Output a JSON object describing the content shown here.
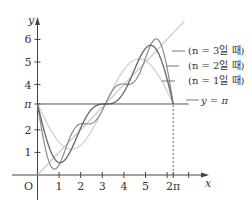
{
  "chart_data": {
    "type": "line",
    "title": "",
    "xlabel": "x",
    "ylabel": "y",
    "origin_label": "O",
    "xlim": [
      0,
      7.6
    ],
    "ylim": [
      0,
      6.7
    ],
    "grid": false,
    "x_ticks": [
      {
        "value": 1,
        "label": "1"
      },
      {
        "value": 2,
        "label": "2"
      },
      {
        "value": 3,
        "label": "3"
      },
      {
        "value": 4,
        "label": "4"
      },
      {
        "value": 5,
        "label": "5"
      },
      {
        "value": 6,
        "label": ""
      },
      {
        "value": 6.2832,
        "label": "2π"
      },
      {
        "value": 7,
        "label": ""
      }
    ],
    "y_ticks": [
      {
        "value": 1,
        "label": "1"
      },
      {
        "value": 2,
        "label": "2"
      },
      {
        "value": 3.1416,
        "label": "π"
      },
      {
        "value": 4,
        "label": "4"
      },
      {
        "value": 5,
        "label": "5"
      },
      {
        "value": 6,
        "label": "6"
      }
    ],
    "series": [
      {
        "name": "(n = 3일 때)",
        "n": 3,
        "formula": "π − 2Σ_{k=1}^{n} sin(kx)/k",
        "x_range": [
          0,
          6.2832
        ],
        "color": "#8a8a8a",
        "width": 1.2
      },
      {
        "name": "(n = 2일 때)",
        "n": 2,
        "formula": "π − 2Σ_{k=1}^{n} sin(kx)/k",
        "x_range": [
          0,
          6.2832
        ],
        "color": "#6e6e6e",
        "width": 1.4
      },
      {
        "name": "(n = 1일 때)",
        "n": 1,
        "formula": "π − 2Σ_{k=1}^{n} sin(kx)/k",
        "x_range": [
          0,
          6.2832
        ],
        "color": "#cfcfcf",
        "width": 1.2
      },
      {
        "name": "y = x",
        "kind": "line",
        "x_range": [
          0,
          6.8
        ],
        "color": "#c8c8c8",
        "width": 1.1
      },
      {
        "name": "y = π",
        "kind": "hline",
        "value": 3.1416,
        "x_range": [
          0,
          7.0
        ],
        "color": "#555555",
        "width": 1.0
      }
    ],
    "annotations": [
      {
        "type": "dashed-vline",
        "x": 6.2832,
        "from_y": 0,
        "to_y": 3.1416
      }
    ],
    "legend": {
      "position": "right",
      "entries": [
        "(n = 3일 때)",
        "(n = 2일 때)",
        "(n = 1일 때)",
        "y = π"
      ]
    }
  }
}
